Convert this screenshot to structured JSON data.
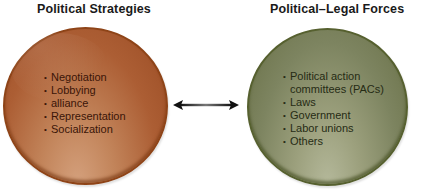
{
  "left_panel": {
    "title": "Political Strategies",
    "color": "#ac5e34",
    "items": [
      "Negotiation",
      "Lobbying",
      "alliance",
      "Representation",
      "Socialization"
    ]
  },
  "right_panel": {
    "title": "Political–Legal Forces",
    "color": "#7d8460",
    "items": [
      "Political action",
      "committees (PACs)",
      "Laws",
      "Government",
      "Labor unions",
      "Others"
    ]
  },
  "connector": {
    "type": "double-headed-arrow",
    "icon": "double-arrow-icon"
  }
}
